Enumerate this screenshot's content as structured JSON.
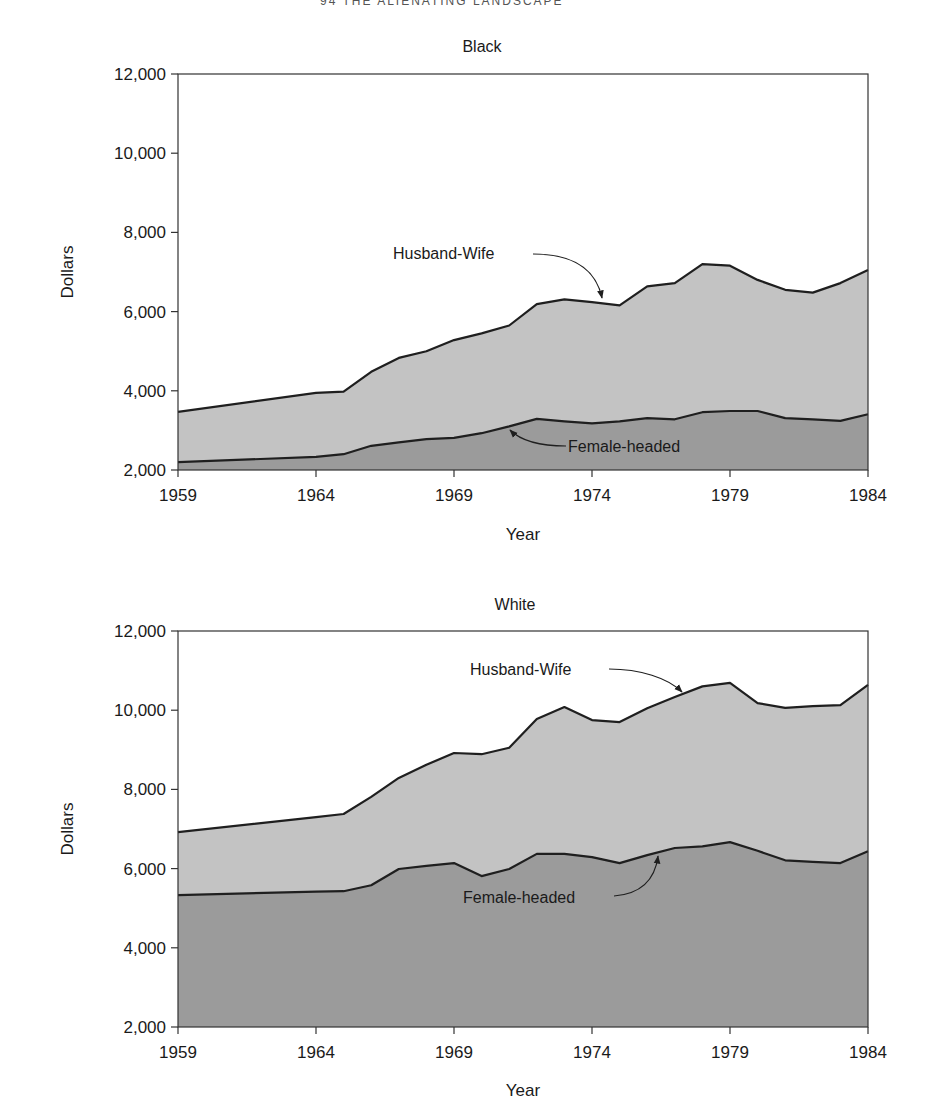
{
  "page": {
    "header_fragment": "94 THE ALIENATING LANDSCAPE"
  },
  "colors": {
    "husband_wife_fill": "#c3c3c3",
    "female_headed_fill": "#9b9b9b",
    "line": "#1f1f1f",
    "axis": "#333333"
  },
  "chart_data": [
    {
      "type": "area",
      "title": "Black",
      "xlabel": "Year",
      "ylabel": "Dollars",
      "xlim": [
        1959,
        1984
      ],
      "ylim": [
        2000,
        12000
      ],
      "x_ticks": [
        1959,
        1964,
        1969,
        1974,
        1979,
        1984
      ],
      "x_tick_labels": [
        "1959",
        "1964",
        "1969",
        "1974",
        "1979",
        "1984"
      ],
      "y_ticks": [
        2000,
        4000,
        6000,
        8000,
        10000,
        12000
      ],
      "y_tick_labels": [
        "2,000",
        "4,000",
        "6,000",
        "8,000",
        "10,000",
        "12,000"
      ],
      "grid": false,
      "x": [
        1959,
        1964,
        1965,
        1966,
        1967,
        1968,
        1969,
        1970,
        1971,
        1972,
        1973,
        1974,
        1975,
        1976,
        1977,
        1978,
        1979,
        1980,
        1981,
        1982,
        1983,
        1984
      ],
      "series": [
        {
          "name": "Husband-Wife",
          "values": [
            3470,
            3950,
            3980,
            4480,
            4830,
            5000,
            5280,
            5450,
            5650,
            6190,
            6310,
            6240,
            6160,
            6640,
            6720,
            7200,
            7160,
            6800,
            6550,
            6480,
            6720,
            7050
          ]
        },
        {
          "name": "Female-headed",
          "values": [
            2200,
            2330,
            2400,
            2610,
            2700,
            2780,
            2810,
            2930,
            3100,
            3290,
            3230,
            3180,
            3230,
            3310,
            3280,
            3460,
            3490,
            3490,
            3310,
            3280,
            3240,
            3410
          ]
        }
      ],
      "annotations": [
        {
          "text": "Husband-Wife",
          "points_to_year": 1974,
          "series": "Husband-Wife"
        },
        {
          "text": "Female-headed",
          "points_to_year": 1970.5,
          "series": "Female-headed"
        }
      ]
    },
    {
      "type": "area",
      "title": "White",
      "xlabel": "Year",
      "ylabel": "Dollars",
      "xlim": [
        1959,
        1984
      ],
      "ylim": [
        2000,
        12000
      ],
      "x_ticks": [
        1959,
        1964,
        1969,
        1974,
        1979,
        1984
      ],
      "x_tick_labels": [
        "1959",
        "1964",
        "1969",
        "1974",
        "1979",
        "1984"
      ],
      "y_ticks": [
        2000,
        4000,
        6000,
        8000,
        10000,
        12000
      ],
      "y_tick_labels": [
        "2,000",
        "4,000",
        "6,000",
        "8,000",
        "10,000",
        "12,000"
      ],
      "grid": false,
      "x": [
        1959,
        1964,
        1965,
        1966,
        1967,
        1968,
        1969,
        1970,
        1971,
        1972,
        1973,
        1974,
        1975,
        1976,
        1977,
        1978,
        1979,
        1980,
        1981,
        1982,
        1983,
        1984
      ],
      "series": [
        {
          "name": "Husband-Wife",
          "values": [
            6920,
            7300,
            7380,
            7810,
            8290,
            8620,
            8920,
            8890,
            9050,
            9780,
            10080,
            9750,
            9700,
            10050,
            10330,
            10600,
            10690,
            10180,
            10060,
            10100,
            10130,
            10640
          ]
        },
        {
          "name": "Female-headed",
          "values": [
            5330,
            5420,
            5430,
            5580,
            5990,
            6070,
            6140,
            5810,
            5990,
            6370,
            6370,
            6290,
            6140,
            6340,
            6520,
            6560,
            6670,
            6450,
            6210,
            6170,
            6140,
            6440
          ]
        }
      ],
      "annotations": [
        {
          "text": "Husband-Wife",
          "points_to_year": 1977,
          "series": "Husband-Wife"
        },
        {
          "text": "Female-headed",
          "points_to_year": 1977,
          "series": "Female-headed"
        }
      ]
    }
  ]
}
